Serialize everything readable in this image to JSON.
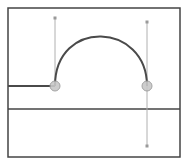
{
  "canvas": {
    "width": 186,
    "height": 162,
    "background": "#ffffff"
  },
  "frame": {
    "x": 8,
    "y": 8,
    "width": 172,
    "height": 149,
    "stroke": "#444444"
  },
  "baseline": {
    "y": 109,
    "stroke": "#444444"
  },
  "path": {
    "stroke": "#4a4a4a",
    "lead_in": {
      "x1": 8,
      "y1": 86,
      "x2": 55,
      "y2": 86
    },
    "arc": {
      "start": [
        55,
        86
      ],
      "end": [
        147,
        86
      ],
      "control1": [
        55,
        18
      ],
      "control2": [
        147,
        22
      ]
    }
  },
  "anchors": [
    {
      "name": "left-anchor",
      "x": 55,
      "y": 86,
      "r": 5,
      "fill": "#c8c8c8"
    },
    {
      "name": "right-anchor",
      "x": 147,
      "y": 86,
      "r": 5,
      "fill": "#c8c8c8"
    }
  ],
  "handles": [
    {
      "name": "left-handle-top",
      "x1": 55,
      "y1": 86,
      "x2": 55,
      "y2": 18
    },
    {
      "name": "right-handle-top",
      "x1": 147,
      "y1": 86,
      "x2": 147,
      "y2": 22
    },
    {
      "name": "right-handle-bottom",
      "x1": 147,
      "y1": 86,
      "x2": 147,
      "y2": 146
    }
  ],
  "handle_style": {
    "stroke": "#b0b0b0",
    "knob_fill": "#9a9a9a"
  }
}
